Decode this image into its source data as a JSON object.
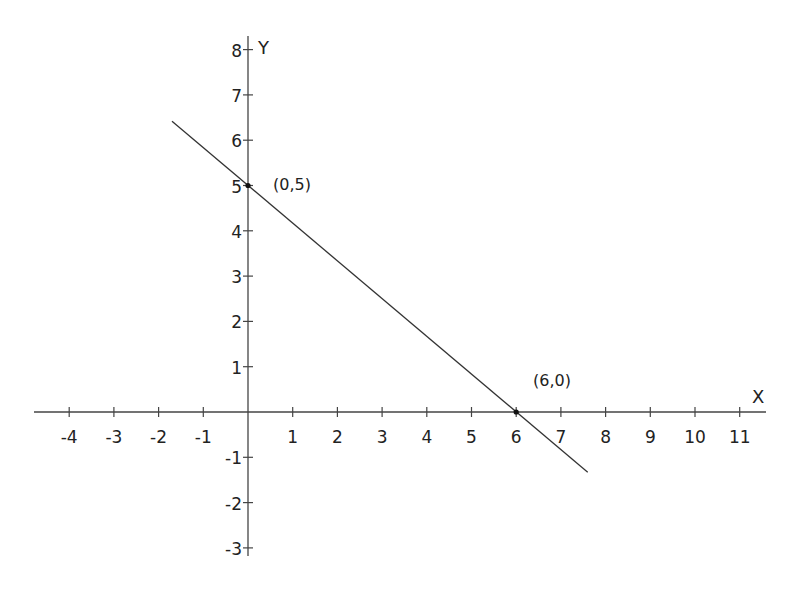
{
  "chart_data": {
    "type": "line",
    "title": "",
    "xlabel": "X",
    "ylabel": "Y",
    "xlim": [
      -4.8,
      11.6
    ],
    "ylim": [
      -3.2,
      8.4
    ],
    "grid": false,
    "x_ticks": [
      -4,
      -3,
      -2,
      -1,
      1,
      2,
      3,
      4,
      5,
      6,
      7,
      8,
      9,
      10,
      11
    ],
    "y_ticks": [
      -3,
      -2,
      -1,
      1,
      2,
      3,
      4,
      5,
      6,
      7,
      8
    ],
    "series": [
      {
        "name": "line",
        "equation": "y = -5/6 x + 5",
        "x": [
          -1.7,
          7.6
        ],
        "y": [
          6.42,
          -1.33
        ]
      }
    ],
    "points": [
      {
        "x": 0,
        "y": 5,
        "label": "(0,5)"
      },
      {
        "x": 6,
        "y": 0,
        "label": "(6,0)"
      }
    ],
    "annotations": [
      "(0,5)",
      "(6,0)"
    ]
  },
  "labels": {
    "x_axis": "X",
    "y_axis": "Y",
    "point_a": "(0,5)",
    "point_b": "(6,0)"
  },
  "colors": {
    "axis": "#444444",
    "line": "#333333",
    "text": "#222222",
    "background": "#ffffff"
  }
}
